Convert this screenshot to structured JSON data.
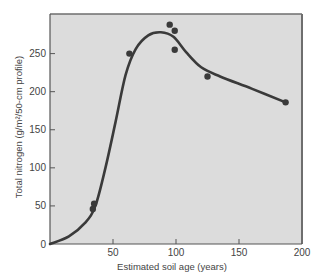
{
  "chart_data": {
    "type": "scatter",
    "title": "",
    "xlabel": "Estimated soil age (years)",
    "ylabel": "Total nitrogen (g/m²/50-cm profile)",
    "xlim": [
      0,
      200
    ],
    "ylim": [
      0,
      302
    ],
    "x_ticks": [
      0,
      50,
      100,
      150,
      200
    ],
    "y_ticks": [
      0,
      50,
      100,
      150,
      200,
      250
    ],
    "grid": false,
    "legend": null,
    "series": [
      {
        "name": "Observed soil nitrogen",
        "kind": "points",
        "points": [
          {
            "x": 34,
            "y": 46
          },
          {
            "x": 35,
            "y": 53
          },
          {
            "x": 63,
            "y": 250
          },
          {
            "x": 95,
            "y": 288
          },
          {
            "x": 99,
            "y": 280
          },
          {
            "x": 99,
            "y": 255
          },
          {
            "x": 125,
            "y": 220
          },
          {
            "x": 187,
            "y": 186
          }
        ]
      },
      {
        "name": "Fitted trend",
        "kind": "smooth-line",
        "points": [
          {
            "x": 0,
            "y": 0
          },
          {
            "x": 15,
            "y": 10
          },
          {
            "x": 28,
            "y": 28
          },
          {
            "x": 36,
            "y": 50
          },
          {
            "x": 44,
            "y": 100
          },
          {
            "x": 52,
            "y": 160
          },
          {
            "x": 60,
            "y": 222
          },
          {
            "x": 68,
            "y": 256
          },
          {
            "x": 78,
            "y": 274
          },
          {
            "x": 88,
            "y": 278
          },
          {
            "x": 98,
            "y": 272
          },
          {
            "x": 108,
            "y": 252
          },
          {
            "x": 120,
            "y": 232
          },
          {
            "x": 135,
            "y": 220
          },
          {
            "x": 160,
            "y": 204
          },
          {
            "x": 187,
            "y": 186
          }
        ]
      }
    ],
    "colors": {
      "plot_background": "#dcdcdc",
      "page_background": "#ffffff",
      "line": "#3a3a3a",
      "points": "#3a3a3a",
      "axis": "#555555",
      "frame_shadow": "#6e6e6e"
    }
  }
}
